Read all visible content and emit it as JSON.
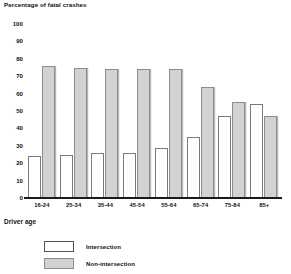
{
  "chart_data": {
    "type": "bar",
    "title": "Percentage of fatal crashes",
    "xlabel": "Driver age",
    "ylabel": "Percentage of fatal crashes",
    "ylim": [
      0,
      100
    ],
    "ytick_step": 10,
    "grid": false,
    "legend_position": "bottom-left",
    "categories": [
      "16-24",
      "25-34",
      "35-44",
      "45-54",
      "55-64",
      "65-74",
      "75-84",
      "85+"
    ],
    "yticks": [
      "100",
      "90",
      "80",
      "70",
      "60",
      "50",
      "40",
      "30",
      "20",
      "10",
      "0"
    ],
    "series": [
      {
        "name": "Intersection",
        "color": "#ffffff",
        "values": [
          24,
          25,
          26,
          26,
          29,
          35,
          47,
          54
        ]
      },
      {
        "name": "Non-intersection",
        "color": "#d2d2d2",
        "values": [
          76,
          75,
          74,
          74,
          74,
          64,
          55,
          47
        ]
      }
    ]
  }
}
